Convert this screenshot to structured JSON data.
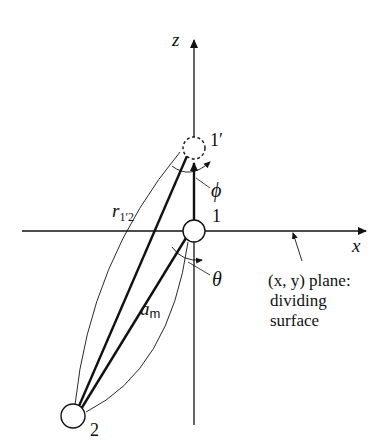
{
  "figure": {
    "axes": {
      "z_label": "z",
      "x_label": "x"
    },
    "atoms": [
      {
        "id": "1",
        "label": "1",
        "style": "solid"
      },
      {
        "id": "1p",
        "label": "1′",
        "style": "dashed"
      },
      {
        "id": "2",
        "label": "2",
        "style": "solid"
      }
    ],
    "angles": {
      "phi": "ϕ",
      "theta": "θ"
    },
    "distances": {
      "r_main": "r",
      "r_sub": "1′2",
      "a_main": "a",
      "a_sub": "m"
    },
    "annotation": {
      "line1": "(x, y) plane:",
      "line2": "dividing",
      "line3": "surface"
    },
    "colors": {
      "ink": "#111111",
      "background": "#ffffff"
    }
  }
}
